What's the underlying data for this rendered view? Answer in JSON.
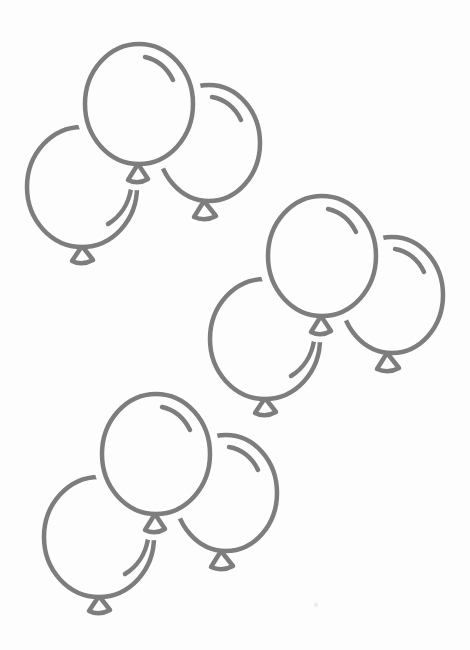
{
  "illustration": {
    "title": "Line-art illustration: three clusters of three outlined balloons on white paper",
    "style": "hand-drawn outline / coloring page",
    "canvas": {
      "width": 470,
      "height": 650
    },
    "paper_color": "#fdfdfd",
    "line_color": "#7d7d7d",
    "line_width": 4.5,
    "body_halo_width": 19,
    "knot_halo_width": 16,
    "soften_blur": 0.35,
    "speck_color": "#e2e2e2",
    "specks": [
      {
        "x": 316,
        "y": 605,
        "r": 2.2
      }
    ],
    "clusters": [
      {
        "id": "top-left",
        "x": 13,
        "y": 40
      },
      {
        "id": "middle-right",
        "x": 196,
        "y": 192
      },
      {
        "id": "bottom-left",
        "x": 30,
        "y": 390
      }
    ],
    "balloons": [
      {
        "name": "balloon-back-left",
        "layer": "back",
        "ellipse": {
          "cx": 69,
          "cy": 147,
          "rx": 55,
          "ry": 60
        },
        "knot_path": "M 69,206 L 59,221 Q 69,226 80,220 Z",
        "highlight_path": "M 118,149 A 46,50 0 0 1 95,184"
      },
      {
        "name": "balloon-back-right",
        "layer": "back",
        "ellipse": {
          "cx": 196,
          "cy": 103,
          "rx": 51,
          "ry": 58
        },
        "knot_path": "M 191,161 L 181,177 Q 192,182 203,176 Z",
        "highlight_path": "M 199,57 A 39,44 0 0 1 228,80"
      },
      {
        "name": "balloon-front-center",
        "layer": "front",
        "ellipse": {
          "cx": 126,
          "cy": 64,
          "rx": 54,
          "ry": 60
        },
        "knot_path": "M 125,124 L 115,140 Q 125,145 135,139 Z",
        "highlight_path": "M 132,17 A 41,47 0 0 1 160,40"
      }
    ]
  }
}
